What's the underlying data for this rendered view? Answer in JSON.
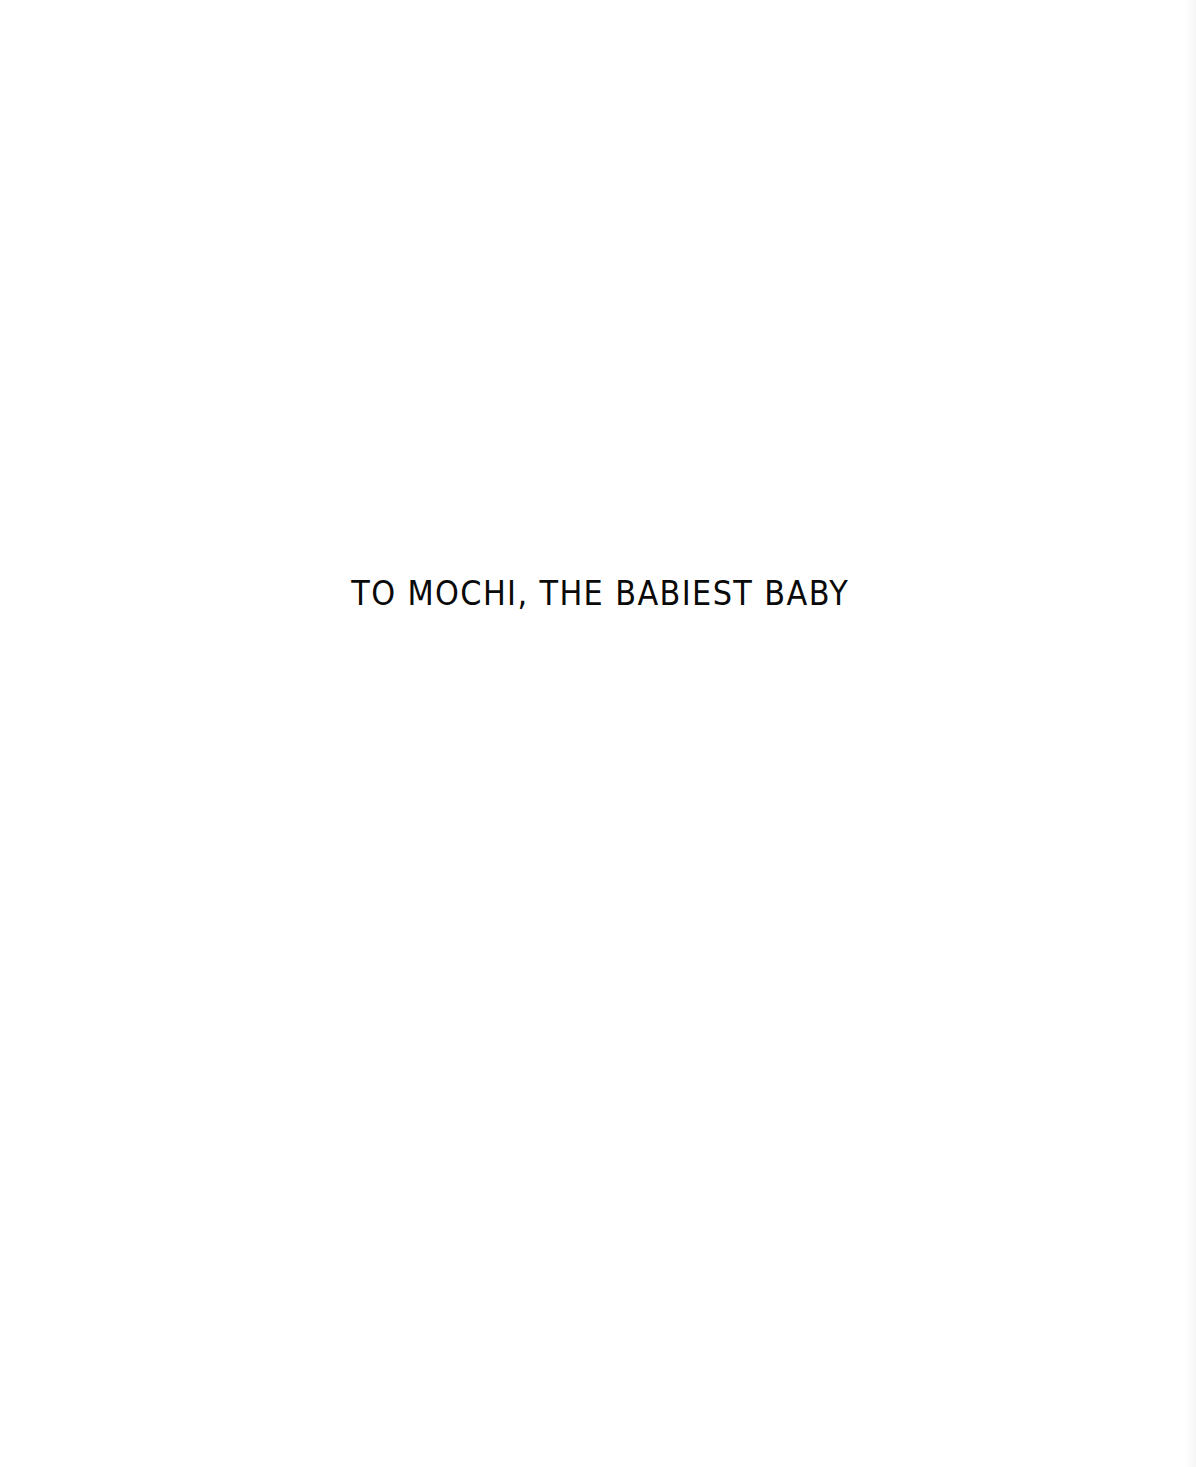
{
  "page": {
    "dedication": "TO MOCHI, THE BABIEST BABY"
  },
  "colors": {
    "background": "#ffffff",
    "text": "#0a0a0a"
  }
}
